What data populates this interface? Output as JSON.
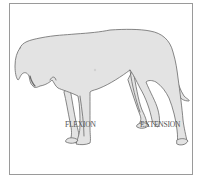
{
  "figure": {
    "labels": {
      "flexion": "FLEXION",
      "extension": "EXTENSION"
    },
    "colors": {
      "body_fill": "#e3e3e3",
      "outline": "#6a6a6a",
      "frame_border": "#9a9a9a",
      "label_text": "#555555"
    }
  }
}
